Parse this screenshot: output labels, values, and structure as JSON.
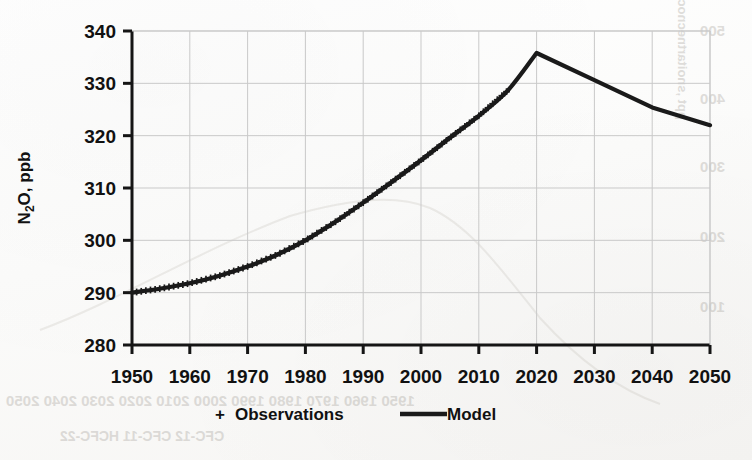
{
  "chart_data": {
    "type": "line",
    "title": "",
    "xlabel": "",
    "ylabel": "N2O, ppb",
    "ylabel_parts": {
      "pre": "N",
      "sub": "2",
      "post": "O, ppb"
    },
    "xlim": [
      1950,
      2050
    ],
    "ylim": [
      280,
      340
    ],
    "xticks": [
      1950,
      1960,
      1970,
      1980,
      1990,
      2000,
      2010,
      2020,
      2030,
      2040,
      2050
    ],
    "yticks": [
      280,
      290,
      300,
      310,
      320,
      330,
      340
    ],
    "grid": true,
    "legend_position": "bottom",
    "legend": [
      {
        "label": "Observations",
        "marker": "plus-marker",
        "style": "marker"
      },
      {
        "label": "Model",
        "marker": "line-swatch",
        "style": "line"
      }
    ],
    "series": [
      {
        "name": "Model",
        "style": "line",
        "color": "#1a1a1a",
        "x": [
          1950,
          1955,
          1960,
          1965,
          1970,
          1975,
          1980,
          1985,
          1990,
          1995,
          2000,
          2005,
          2010,
          2015,
          2020,
          2030,
          2040,
          2050
        ],
        "values": [
          290.0,
          290.8,
          291.8,
          293.2,
          295.0,
          297.2,
          300.0,
          303.4,
          307.2,
          311.2,
          315.3,
          319.6,
          323.8,
          328.6,
          335.8,
          330.6,
          325.4,
          322.0
        ]
      },
      {
        "name": "Observations",
        "style": "marker",
        "marker": "plus",
        "color": "#1a1a1a",
        "x_range": [
          1950,
          2015
        ],
        "x": [
          1950,
          1953,
          1956,
          1959,
          1962,
          1965,
          1968,
          1971,
          1974,
          1977,
          1980,
          1983,
          1986,
          1989,
          1992,
          1995,
          1998,
          2001,
          2004,
          2007,
          2010,
          2013,
          2015
        ],
        "values": [
          290.0,
          290.3,
          290.9,
          291.8,
          292.8,
          293.9,
          295.3,
          296.9,
          298.7,
          300.9,
          303.2,
          305.6,
          308.0,
          310.3,
          312.6,
          314.9,
          317.3,
          319.6,
          322.0,
          324.3,
          326.0,
          326.8,
          327.0
        ]
      }
    ],
    "annotations": [
      {
        "name": "peak",
        "x": 2020,
        "y": 335.8
      },
      {
        "name": "slope-change",
        "x": 2040,
        "y": 325.4
      }
    ]
  },
  "background_artifacts": {
    "description": "faint mirrored bleed-through from reverse of scanned page",
    "ghost_year_row": "1950 1960 1970 1980 1990 2000 2010 2020 2030 2040 2050",
    "ghost_legend_row": "CFC-12        CFC-11        HCFC-22",
    "ghost_axis_title": "ppt  ,snoitartnecnoc",
    "ghost_ytick_labels": [
      "500",
      "400",
      "300",
      "200",
      "100"
    ]
  }
}
